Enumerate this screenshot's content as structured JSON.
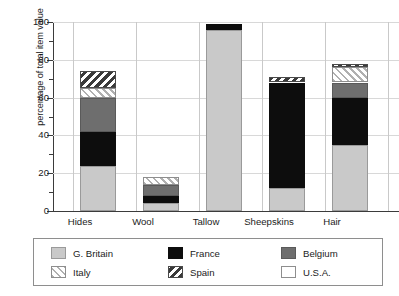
{
  "chart_data": {
    "type": "bar",
    "subtype": "stacked-bar-100",
    "title": "",
    "xlabel": "",
    "ylabel": "percentage of total item value",
    "ylim": [
      0,
      100
    ],
    "yticks": [
      0,
      20,
      40,
      60,
      80,
      100
    ],
    "ytick_labels": [
      "0",
      "20",
      "40",
      "60",
      "80",
      "100"
    ],
    "yminor_ticks": [
      10,
      30,
      50,
      70,
      90
    ],
    "grid": "horizontal-dotted",
    "legend_position": "bottom",
    "categories": [
      "Hides",
      "Wool",
      "Tallow",
      "Sheepskins",
      "Hair"
    ],
    "series": [
      {
        "name": "G. Britain",
        "key": "gbritain",
        "color": "#c9c9c9",
        "pattern": "solid-light-gray",
        "values": [
          24,
          4,
          96,
          12,
          35
        ]
      },
      {
        "name": "France",
        "key": "france",
        "color": "#0d0d0d",
        "pattern": "solid-black",
        "values": [
          18,
          4,
          3,
          56,
          25
        ]
      },
      {
        "name": "Belgium",
        "key": "belgium",
        "color": "#6e6e6e",
        "pattern": "solid-dark-gray",
        "values": [
          18,
          6,
          0,
          0,
          8
        ]
      },
      {
        "name": "Italy",
        "key": "italy",
        "color": "#ffffff",
        "pattern": "light-forward-hatch",
        "values": [
          5,
          4,
          0,
          0,
          8
        ]
      },
      {
        "name": "Spain",
        "key": "spain",
        "color": "#3a3a3a",
        "pattern": "dark-back-hatch",
        "values": [
          9,
          0,
          0,
          3,
          2
        ]
      },
      {
        "name": "U.S.A.",
        "key": "usa",
        "color": "#ffffff",
        "pattern": "empty-white",
        "values": [
          0,
          0,
          0,
          0,
          0
        ]
      }
    ],
    "bar_totals": [
      74,
      18,
      99,
      71,
      78
    ]
  },
  "axis": {
    "y_title": "percentage of total item value",
    "y_tick_labels": [
      "100",
      "80",
      "60",
      "40",
      "20",
      "0"
    ]
  },
  "categories": {
    "labels": [
      "Hides",
      "Wool",
      "Tallow",
      "Sheepskins",
      "Hair"
    ]
  },
  "legend": {
    "entries": [
      {
        "label": "G. Britain"
      },
      {
        "label": "France"
      },
      {
        "label": "Belgium"
      },
      {
        "label": "Italy"
      },
      {
        "label": "Spain"
      },
      {
        "label": "U.S.A."
      }
    ]
  }
}
